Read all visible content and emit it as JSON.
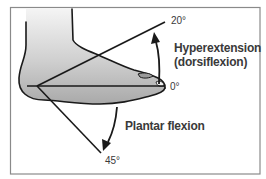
{
  "diagram": {
    "angles": {
      "hyperextension": "20°",
      "neutral": "0°",
      "plantar": "45°"
    },
    "labels": {
      "hyperextension_line1": "Hyperextension",
      "hyperextension_line2": "(dorsiflexion)",
      "plantar_flexion": "Plantar flexion"
    },
    "colors": {
      "line": "#1a1a1a",
      "border": "#8a8a8a",
      "foot_fill_light": "#f2f2f2",
      "foot_fill_dark": "#a8a8a8",
      "text": "#3a3a3a"
    }
  }
}
